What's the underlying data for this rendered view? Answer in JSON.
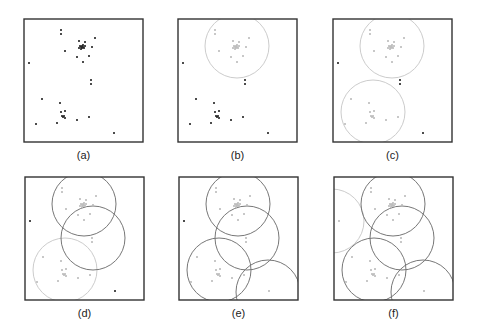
{
  "figure": {
    "box": {
      "width": 119,
      "height": 123,
      "stroke": "#333333"
    },
    "colors": {
      "point_dark": "#222222",
      "point_light": "#bbbbbb",
      "circle_dark": "#777777",
      "circle_light": "#cccccc"
    },
    "points": [
      [
        37,
        11
      ],
      [
        37,
        15
      ],
      [
        71,
        19
      ],
      [
        55,
        22
      ],
      [
        61,
        23
      ],
      [
        57,
        28
      ],
      [
        58,
        27
      ],
      [
        59,
        28
      ],
      [
        56,
        27
      ],
      [
        60,
        29
      ],
      [
        58,
        29
      ],
      [
        57,
        30
      ],
      [
        59,
        26
      ],
      [
        61,
        27
      ],
      [
        55,
        29
      ],
      [
        68,
        28
      ],
      [
        41,
        32
      ],
      [
        5,
        44
      ],
      [
        53,
        38
      ],
      [
        65,
        37
      ],
      [
        59,
        43
      ],
      [
        67,
        61
      ],
      [
        67,
        65
      ],
      [
        18,
        80
      ],
      [
        36,
        84
      ],
      [
        37,
        93
      ],
      [
        41,
        92
      ],
      [
        38,
        97
      ],
      [
        39,
        98
      ],
      [
        40,
        97
      ],
      [
        41,
        99
      ],
      [
        53,
        101
      ],
      [
        65,
        98
      ],
      [
        12,
        105
      ],
      [
        33,
        104
      ],
      [
        90,
        114
      ]
    ],
    "circles": {
      "C1": {
        "cx": 59,
        "cy": 27,
        "r": 32
      },
      "C2": {
        "cx": 40,
        "cy": 93,
        "r": 32
      },
      "C3": {
        "cx": 68,
        "cy": 61,
        "r": 32
      },
      "C4": {
        "cx": 89,
        "cy": 115,
        "r": 32
      },
      "C5": {
        "cx": -2,
        "cy": 44,
        "r": 32
      }
    },
    "panels": [
      {
        "label": "(a)",
        "x": 24,
        "y": 19,
        "circles": []
      },
      {
        "label": "(b)",
        "x": 178,
        "y": 19,
        "circles": [
          [
            "C1",
            "light"
          ]
        ]
      },
      {
        "label": "(c)",
        "x": 333,
        "y": 19,
        "circles": [
          [
            "C1",
            "light"
          ],
          [
            "C2",
            "light"
          ]
        ]
      },
      {
        "label": "(d)",
        "x": 25,
        "y": 177,
        "circles": [
          [
            "C1",
            "dark"
          ],
          [
            "C3",
            "dark"
          ],
          [
            "C2",
            "light"
          ]
        ]
      },
      {
        "label": "(e)",
        "x": 179,
        "y": 177,
        "circles": [
          [
            "C1",
            "dark"
          ],
          [
            "C3",
            "dark"
          ],
          [
            "C2",
            "dark"
          ],
          [
            "C4",
            "dark"
          ]
        ]
      },
      {
        "label": "(f)",
        "x": 334,
        "y": 177,
        "circles": [
          [
            "C1",
            "dark"
          ],
          [
            "C3",
            "dark"
          ],
          [
            "C2",
            "dark"
          ],
          [
            "C4",
            "dark"
          ],
          [
            "C5",
            "light"
          ]
        ]
      }
    ]
  }
}
